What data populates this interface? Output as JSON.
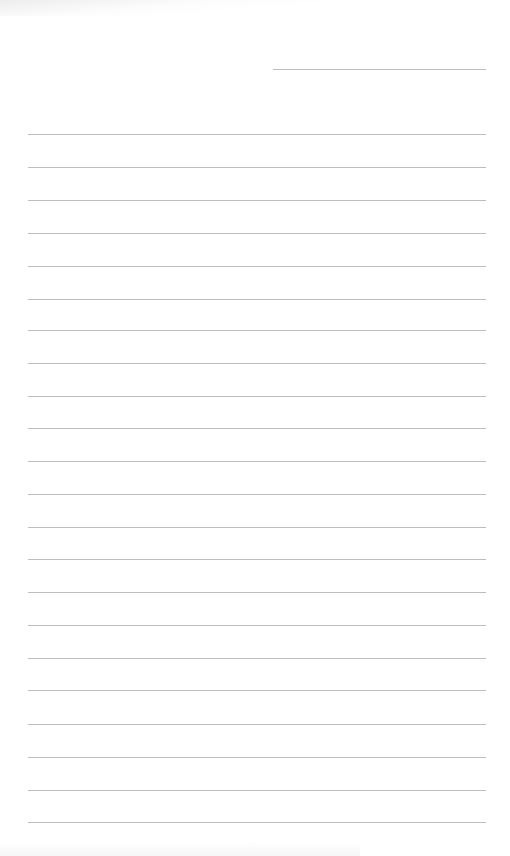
{
  "document": {
    "type": "lined-paper",
    "background_color": "#ffffff",
    "line_color": "#bdbdbd",
    "date_line": {
      "x1": 273,
      "x2": 486,
      "y": 69
    },
    "ruled_lines": {
      "x1": 28,
      "x2": 486,
      "y_positions": [
        134,
        167,
        200,
        233,
        266,
        299,
        330,
        363,
        396,
        428,
        461,
        494,
        527,
        559,
        592,
        625,
        658,
        690,
        724,
        757,
        790,
        822
      ]
    }
  }
}
